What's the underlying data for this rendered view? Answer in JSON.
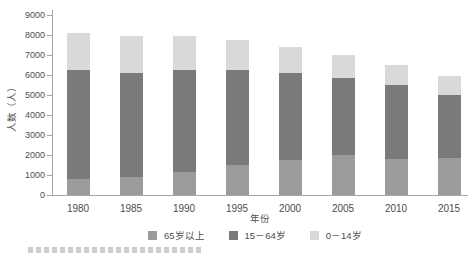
{
  "chart_data": {
    "type": "bar",
    "stacked": true,
    "title": "",
    "xlabel": "年份",
    "ylabel": "人数（人）",
    "categories": [
      "1980",
      "1985",
      "1990",
      "1995",
      "2000",
      "2005",
      "2010",
      "2015"
    ],
    "series": [
      {
        "name": "65岁以上",
        "color": "#9c9c9c",
        "values": [
          800,
          900,
          1150,
          1500,
          1750,
          2000,
          1800,
          1850
        ]
      },
      {
        "name": "15－64岁",
        "color": "#7a7a7a",
        "values": [
          5450,
          5200,
          5100,
          4750,
          4350,
          3850,
          3700,
          3150
        ]
      },
      {
        "name": "0－14岁",
        "color": "#d9d9d9",
        "values": [
          1850,
          1850,
          1700,
          1500,
          1300,
          1150,
          1000,
          950
        ]
      }
    ],
    "totals": [
      8100,
      7950,
      7950,
      7750,
      7400,
      7000,
      6500,
      5950
    ],
    "ylim": [
      0,
      9000
    ],
    "yticks": [
      0,
      1000,
      2000,
      3000,
      4000,
      5000,
      6000,
      7000,
      8000,
      9000
    ],
    "grid": false,
    "legend_position": "bottom",
    "axis_color": "#a6a6a6",
    "text_color": "#4d4d4d"
  }
}
